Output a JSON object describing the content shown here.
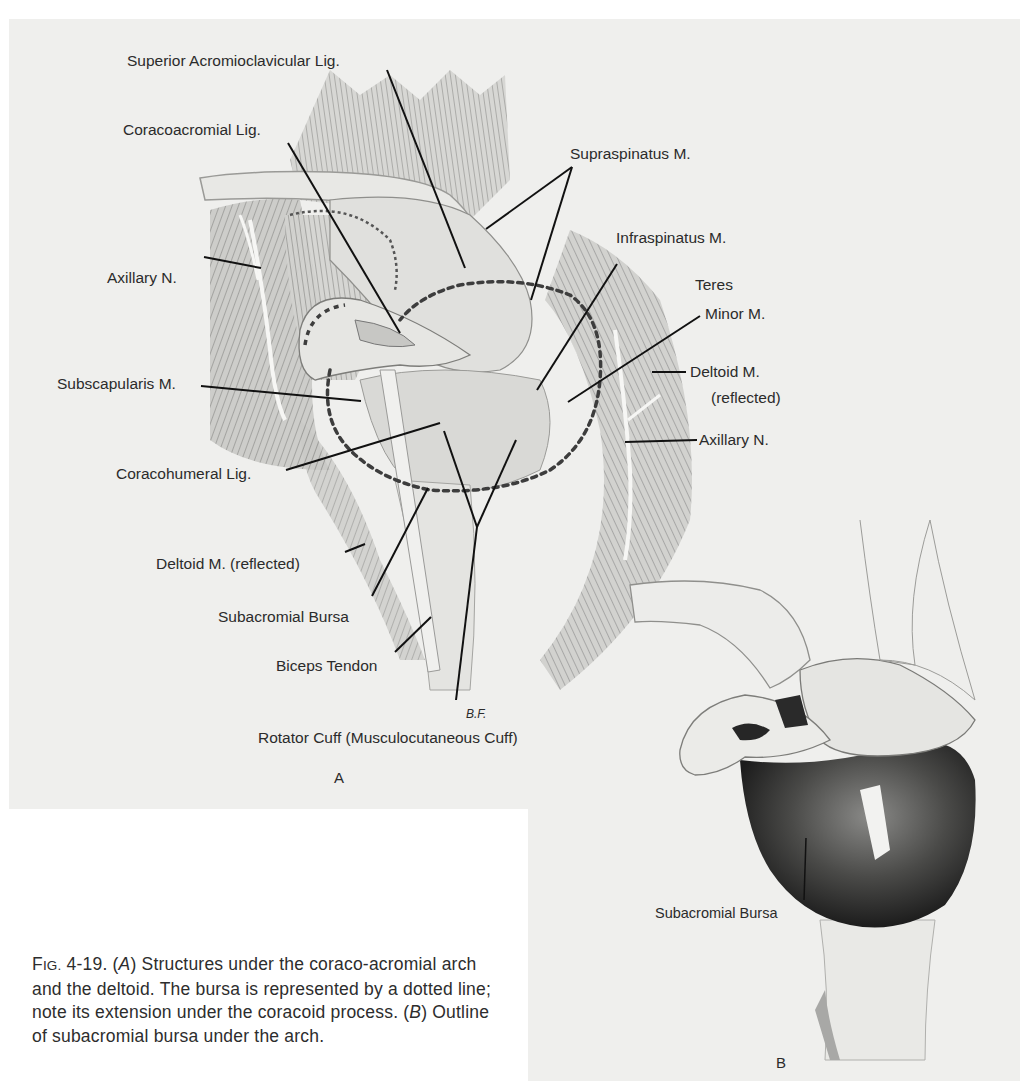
{
  "figure": {
    "number": "4-19",
    "panel_a": {
      "letter": "A",
      "labels": {
        "superior_acromioclavicular_lig": "Superior Acromioclavicular Lig.",
        "coracoacromial_lig": "Coracoacromial Lig.",
        "supraspinatus_m": "Supraspinatus M.",
        "infraspinatus_m": "Infraspinatus M.",
        "teres": "Teres",
        "minor_m": "Minor M.",
        "axillary_n_left": "Axillary N.",
        "subscapularis_m": "Subscapularis M.",
        "deltoid_m_right": "Deltoid M.",
        "deltoid_reflected_right": "(reflected)",
        "axillary_n_right": "Axillary N.",
        "coracohumeral_lig": "Coracohumeral Lig.",
        "deltoid_m_reflected_left": "Deltoid M. (reflected)",
        "subacromial_bursa": "Subacromial Bursa",
        "biceps_tendon": "Biceps Tendon",
        "rotator_cuff": "Rotator Cuff (Musculocutaneous Cuff)",
        "artist_signature": "B.F."
      }
    },
    "panel_b": {
      "letter": "B",
      "labels": {
        "subacromial_bursa": "Subacromial Bursa"
      }
    },
    "caption": {
      "fig_prefix": "Fig.",
      "fig_number": "4-19.",
      "a_marker": "A",
      "a_text": "Structures under the coraco-acromial arch and the deltoid. The bursa is represented by a dotted line; note its extension under the coracoid process.",
      "b_marker": "B",
      "b_text": "Outline of subacromial bursa under the arch."
    }
  },
  "colors": {
    "background": "#ffffff",
    "panel_gray": "#efefed",
    "ink": "#2b2b2b",
    "bursa_dark": "#1e1e1e"
  }
}
